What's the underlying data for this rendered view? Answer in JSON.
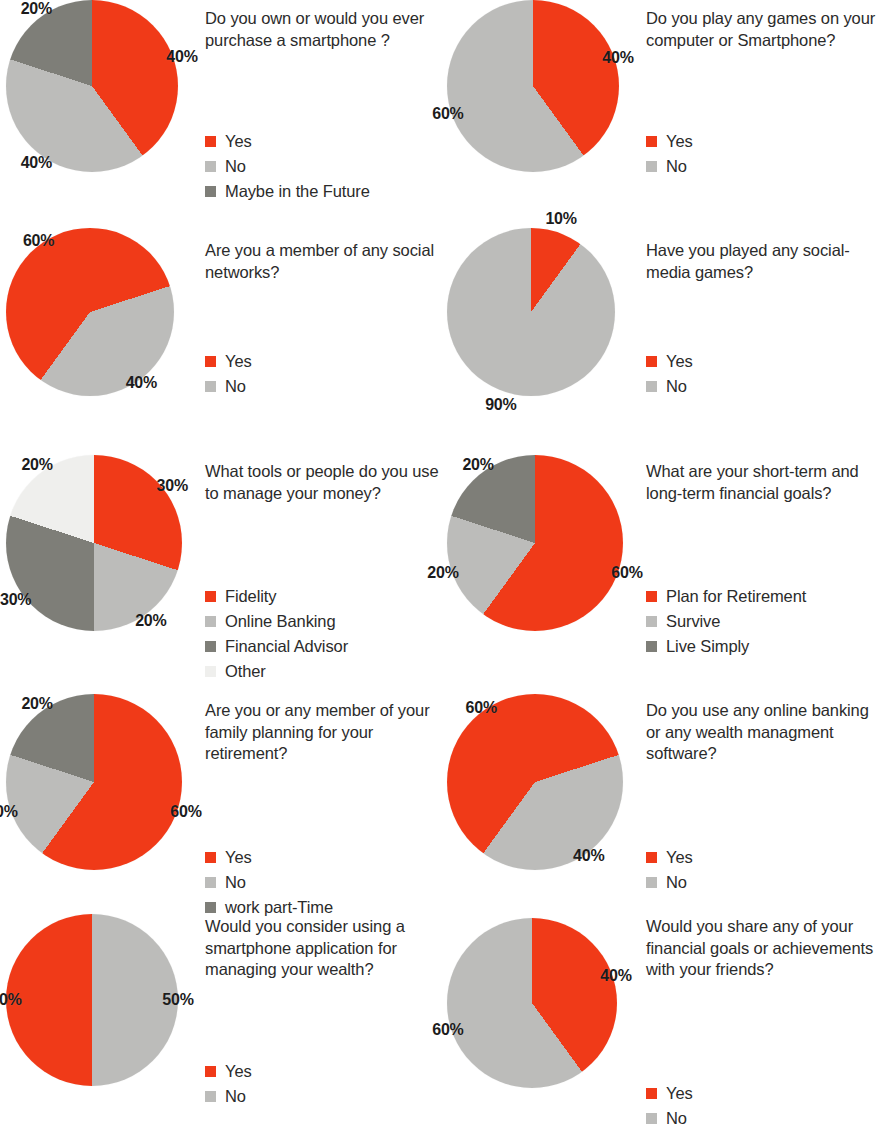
{
  "palette": {
    "red": "#F03A18",
    "light_gray": "#BCBCBA",
    "dark_gray": "#7E7E78",
    "white_gray": "#EFEFED",
    "text": "#2b2b2b",
    "background": "#ffffff"
  },
  "chart_data": [
    {
      "id": "smartphone-ownership",
      "type": "pie",
      "title": "Do you own or would you ever purchase a smartphone ?",
      "categories": [
        "Yes",
        "No",
        "Maybe in the Future"
      ],
      "values": [
        40,
        40,
        20
      ],
      "colors": [
        "#F03A18",
        "#BCBCBA",
        "#7E7E78"
      ],
      "data_labels": [
        "40%",
        "40%",
        "20%"
      ],
      "legend_position": "right"
    },
    {
      "id": "play-games",
      "type": "pie",
      "title": "Do you play any games on your computer or Smartphone?",
      "categories": [
        "Yes",
        "No"
      ],
      "values": [
        40,
        60
      ],
      "colors": [
        "#F03A18",
        "#BCBCBA"
      ],
      "data_labels": [
        "40%",
        "60%"
      ],
      "legend_position": "right"
    },
    {
      "id": "social-networks",
      "type": "pie",
      "title": "Are you a member of any social networks?",
      "categories": [
        "Yes",
        "No"
      ],
      "values": [
        60,
        40
      ],
      "colors": [
        "#F03A18",
        "#BCBCBA"
      ],
      "data_labels": [
        "60%",
        "40%"
      ],
      "legend_position": "right"
    },
    {
      "id": "social-media-games",
      "type": "pie",
      "title": "Have you played any social-media games?",
      "categories": [
        "Yes",
        "No"
      ],
      "values": [
        10,
        90
      ],
      "colors": [
        "#F03A18",
        "#BCBCBA"
      ],
      "data_labels": [
        "10%",
        "90%"
      ],
      "legend_position": "right"
    },
    {
      "id": "money-management-tools",
      "type": "pie",
      "title": "What tools or people do you use to manage your money?",
      "categories": [
        "Fidelity",
        "Online Banking",
        "Financial Advisor",
        "Other"
      ],
      "values": [
        30,
        20,
        30,
        20
      ],
      "colors": [
        "#F03A18",
        "#BCBCBA",
        "#7E7E78",
        "#EFEFED"
      ],
      "data_labels": [
        "30%",
        "20%",
        "30%",
        "20%"
      ],
      "legend_position": "right"
    },
    {
      "id": "financial-goals",
      "type": "pie",
      "title": "What are your short-term and long-term financial goals?",
      "categories": [
        "Plan for Retirement",
        "Survive",
        "Live Simply"
      ],
      "values": [
        60,
        20,
        20
      ],
      "colors": [
        "#F03A18",
        "#BCBCBA",
        "#7E7E78"
      ],
      "data_labels": [
        "60%",
        "20%",
        "20%"
      ],
      "legend_position": "right"
    },
    {
      "id": "retirement-planning",
      "type": "pie",
      "title": "Are you or any member of your family planning for your retirement?",
      "categories": [
        "Yes",
        "No",
        "work part-Time"
      ],
      "values": [
        60,
        20,
        20
      ],
      "colors": [
        "#F03A18",
        "#BCBCBA",
        "#7E7E78"
      ],
      "data_labels": [
        "60%",
        "20%",
        "20%"
      ],
      "legend_position": "right"
    },
    {
      "id": "online-banking-usage",
      "type": "pie",
      "title": "Do you use any online banking or any wealth managment software?",
      "categories": [
        "Yes",
        "No"
      ],
      "values": [
        60,
        40
      ],
      "colors": [
        "#F03A18",
        "#BCBCBA"
      ],
      "data_labels": [
        "60%",
        "40%"
      ],
      "legend_position": "right"
    },
    {
      "id": "smartphone-wealth-app",
      "type": "pie",
      "title": "Would you consider using a smartphone application for managing your wealth?",
      "categories": [
        "Yes",
        "No"
      ],
      "values": [
        50,
        50
      ],
      "colors": [
        "#F03A18",
        "#BCBCBA"
      ],
      "data_labels": [
        "50%",
        "50%"
      ],
      "legend_position": "right"
    },
    {
      "id": "share-financial-goals",
      "type": "pie",
      "title": "Would you share any of your financial goals or achievements with your friends?",
      "categories": [
        "Yes",
        "No"
      ],
      "values": [
        40,
        60
      ],
      "colors": [
        "#F03A18",
        "#BCBCBA"
      ],
      "data_labels": [
        "40%",
        "60%"
      ],
      "legend_position": "right"
    }
  ],
  "layout": {
    "cells": [
      {
        "chart": 0,
        "x": 0,
        "y": 0,
        "pie_top": 0,
        "pie_d": 172,
        "text_top": 8,
        "legend_top": 86,
        "start_angle": 0,
        "label_r": 0.55
      },
      {
        "chart": 1,
        "x": 441,
        "y": 0,
        "pie_top": 0,
        "pie_d": 172,
        "text_top": 8,
        "legend_top": 86,
        "start_angle": 0,
        "label_r": 0.52
      },
      {
        "chart": 2,
        "x": 0,
        "y": 228,
        "pie_top": 0,
        "pie_d": 168,
        "text_top": 12,
        "legend_top": 78,
        "start_angle": 216,
        "label_r": 0.52
      },
      {
        "chart": 3,
        "x": 441,
        "y": 228,
        "pie_top": 0,
        "pie_d": 168,
        "text_top": 12,
        "legend_top": 78,
        "start_angle": 0,
        "label_r": 0.58
      },
      {
        "chart": 4,
        "x": 0,
        "y": 455,
        "pie_top": 0,
        "pie_d": 176,
        "text_top": 6,
        "legend_top": 86,
        "start_angle": 0,
        "label_r": 0.55
      },
      {
        "chart": 5,
        "x": 441,
        "y": 455,
        "pie_top": 0,
        "pie_d": 176,
        "text_top": 6,
        "legend_top": 86,
        "start_angle": 0,
        "label_r": 0.55
      },
      {
        "chart": 6,
        "x": 0,
        "y": 694,
        "pie_top": 0,
        "pie_d": 176,
        "text_top": 6,
        "legend_top": 86,
        "start_angle": 0,
        "label_r": 0.55
      },
      {
        "chart": 7,
        "x": 441,
        "y": 694,
        "pie_top": 0,
        "pie_d": 176,
        "text_top": 6,
        "legend_top": 86,
        "start_angle": 216,
        "label_r": 0.52
      },
      {
        "chart": 8,
        "x": 0,
        "y": 908,
        "pie_top": 6,
        "pie_d": 172,
        "text_top": 8,
        "legend_top": 86,
        "start_angle": 180,
        "label_r": 0.5
      },
      {
        "chart": 9,
        "x": 441,
        "y": 908,
        "pie_top": 10,
        "pie_d": 170,
        "text_top": 8,
        "legend_top": 108,
        "start_angle": 0,
        "label_r": 0.52
      }
    ]
  }
}
